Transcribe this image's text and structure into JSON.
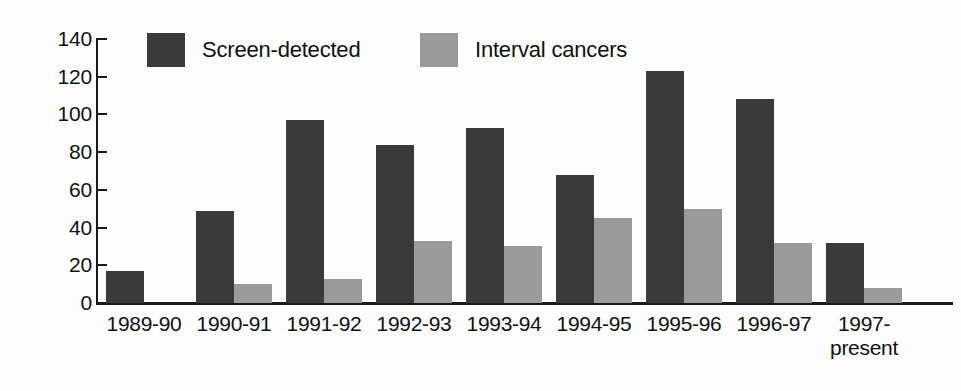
{
  "chart_data": {
    "type": "bar",
    "title": "",
    "subtitle": "",
    "xlabel": "",
    "ylabel": "",
    "ylim": [
      0,
      140
    ],
    "yticks": [
      0,
      20,
      40,
      60,
      80,
      100,
      120,
      140
    ],
    "grid": false,
    "legend_position": "top-inside",
    "categories": [
      "1989-90",
      "1990-91",
      "1991-92",
      "1992-93",
      "1993-94",
      "1994-95",
      "1995-96",
      "1996-97",
      "1997-\npresent"
    ],
    "series": [
      {
        "name": "Screen-detected",
        "color": "#3a3a3a",
        "values": [
          17,
          49,
          97,
          84,
          93,
          68,
          123,
          108,
          32
        ]
      },
      {
        "name": "Interval cancers",
        "color": "#9a9a9a",
        "values": [
          0,
          10,
          13,
          33,
          30,
          45,
          50,
          32,
          8
        ]
      }
    ]
  },
  "legend": {
    "items": [
      {
        "label": "Screen-detected",
        "swatch": "dark"
      },
      {
        "label": "Interval cancers",
        "swatch": "light"
      }
    ]
  },
  "colors": {
    "screen_detected": "#3a3a3a",
    "interval_cancers": "#9a9a9a",
    "axis": "#1a1a1a",
    "background": "#fdfdfd"
  }
}
